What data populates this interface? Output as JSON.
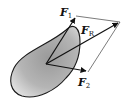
{
  "diagram": {
    "type": "force-vector-parallelogram",
    "body_fill": "#a8a8a8",
    "outline_color": "#1a1a1a",
    "vectors": [
      {
        "id": "F1",
        "label": "F",
        "subscript": "1"
      },
      {
        "id": "FR",
        "label": "F",
        "subscript": "R"
      },
      {
        "id": "F2",
        "label": "F",
        "subscript": "2"
      }
    ]
  }
}
